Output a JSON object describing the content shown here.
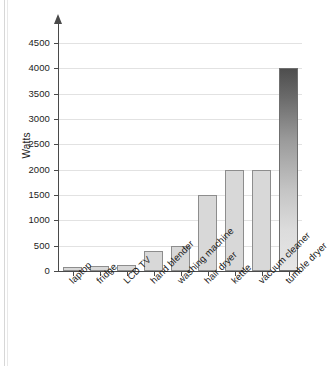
{
  "chart_data": {
    "type": "bar",
    "title": "",
    "subtitle": "",
    "xlabel": "",
    "ylabel": "Watts",
    "ylim": [
      0,
      4500
    ],
    "yticks": [
      0,
      500,
      1000,
      1500,
      2000,
      2500,
      3000,
      3500,
      4000,
      4500
    ],
    "ytick_labels": [
      "0",
      "500",
      "1000",
      "1500",
      "2000",
      "2500",
      "3000",
      "3500",
      "4000",
      "4500"
    ],
    "grid": true,
    "legend": false,
    "legend_position": "none",
    "categories": [
      "laptop",
      "fridge",
      "LCD TV",
      "hand blender",
      "washing machine",
      "hair dryer",
      "kettle",
      "vacuum cleaner",
      "tumble dryer"
    ],
    "values": [
      70,
      100,
      120,
      400,
      500,
      1500,
      2000,
      2000,
      4000
    ],
    "bar_colors": [
      "#d8d8d8",
      "#d8d8d8",
      "#d8d8d8",
      "#d8d8d8",
      "#d8d8d8",
      "#d8d8d8",
      "#d8d8d8",
      "#d8d8d8",
      "gradient-dark-to-light"
    ],
    "bar_border_color": "#8d8d8d",
    "axis_color": "#4a4a4a",
    "gridline_color": "#e2e2e2",
    "background_color": "#ffffff",
    "annotations": []
  }
}
